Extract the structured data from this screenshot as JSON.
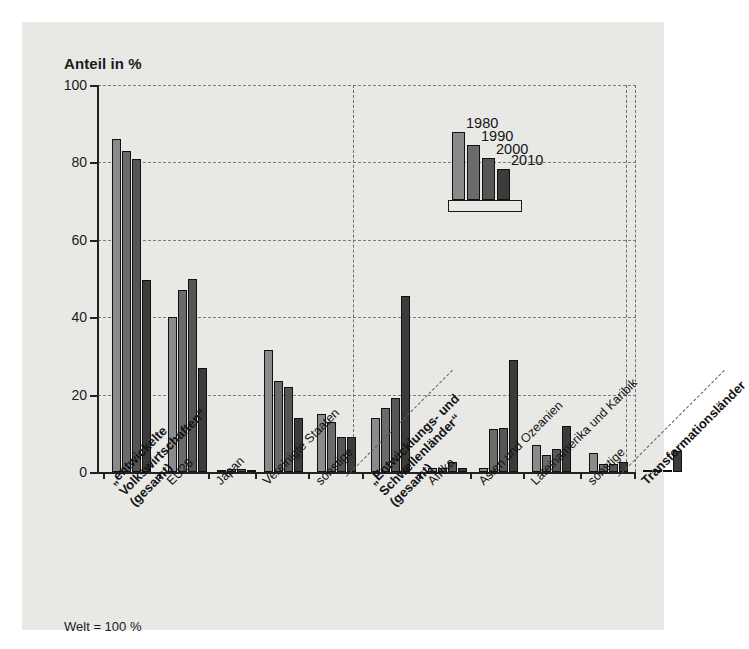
{
  "figure": {
    "axis_title": "Anteil in %",
    "footnote": "Welt = 100 %"
  },
  "legend": {
    "entries": [
      {
        "label": "1980",
        "color": "#8b8b8b"
      },
      {
        "label": "1990",
        "color": "#6b6b6b"
      },
      {
        "label": "2000",
        "color": "#565656"
      },
      {
        "label": "2010",
        "color": "#3b3b3b"
      }
    ]
  },
  "chart_data": {
    "type": "bar",
    "title": "",
    "subtitle": "",
    "xlabel": "",
    "ylabel": "Anteil in %",
    "ylim": [
      0,
      100
    ],
    "yticks": [
      0,
      20,
      40,
      60,
      80,
      100
    ],
    "grid": "horizontal-dashed",
    "legend_position": "inside-top-center",
    "annotations": [
      "Welt = 100 %"
    ],
    "categories": [
      "„entwickelte Volkswirtschaften“ (gesamt)",
      "EU28",
      "Japan",
      "Vereinigte Staaten",
      "sonstige",
      "„Entwicklungs- und Schwellenländer“ (gesamt)",
      "Afrika",
      "Asien und Ozeanien",
      "Lateinamerika und Karibik",
      "sonstige",
      "Transformationsländer"
    ],
    "series": [
      {
        "name": "1980",
        "values": [
          86,
          40,
          0.5,
          31.5,
          15,
          14,
          1,
          1,
          7,
          5,
          0.3
        ]
      },
      {
        "name": "1990",
        "values": [
          83,
          47,
          0.8,
          23.5,
          13,
          16.5,
          1,
          11,
          4.5,
          2,
          0.3
        ]
      },
      {
        "name": "2000",
        "values": [
          81,
          50,
          0.8,
          22,
          9,
          19,
          2.5,
          11.5,
          6,
          2,
          0.6
        ]
      },
      {
        "name": "2010",
        "values": [
          49.5,
          27,
          0.6,
          14,
          9,
          45.5,
          1,
          29,
          12,
          2.5,
          5.5
        ]
      }
    ]
  },
  "xlabels": [
    {
      "text": "„entwickelte",
      "sub1": "Volkswirtschaften“",
      "sub2": "(gesamt)",
      "bold": true
    },
    {
      "text": "EU28",
      "bold": false
    },
    {
      "text": "Japan",
      "bold": false
    },
    {
      "text": "Vereinigte Staaten",
      "bold": false
    },
    {
      "text": "sonstige",
      "bold": false
    },
    {
      "text": "„Entwicklungs- und",
      "sub1": "Schwellenländer“",
      "sub2": "(gesamt)",
      "bold": true
    },
    {
      "text": "Afrika",
      "bold": false
    },
    {
      "text": "Asien und Ozeanien",
      "bold": false
    },
    {
      "text": "Lateinamerika und Karibik",
      "bold": false
    },
    {
      "text": "sonstige",
      "bold": false
    },
    {
      "text": "Transformationsländer",
      "bold": true
    }
  ]
}
